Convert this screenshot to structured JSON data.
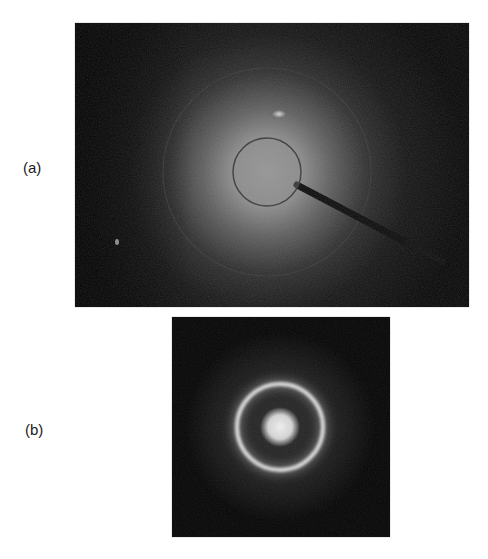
{
  "figure": {
    "panels": [
      {
        "label": "(a)",
        "description": "Wide-angle diffraction pattern with diffuse central halo, beam stop and arm",
        "features": {
          "halo_center": [
            192,
            149
          ],
          "beamstop_radius": 34,
          "outer_ring_radius": 104,
          "bright_spot": [
            204,
            91
          ],
          "small_spot": [
            42,
            219
          ]
        }
      },
      {
        "label": "(b)",
        "description": "Diffraction pattern with bright central spot and single sharp ring",
        "features": {
          "center": [
            108,
            110
          ],
          "ring_radius": 43,
          "center_spot_radius": 14
        }
      }
    ]
  },
  "colors": {
    "background": "#ffffff",
    "panel_background": "#050505",
    "label_text": "#1a1a1a",
    "beamstop_outline": "#3a3a3a",
    "arm": "#0a0a0a"
  }
}
